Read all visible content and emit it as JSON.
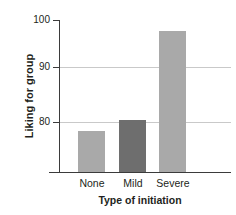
{
  "chart_data": {
    "type": "bar",
    "title": "",
    "categories": [
      "None",
      "Mild",
      "Severe"
    ],
    "values": [
      80,
      82,
      98
    ],
    "series": [
      {
        "name": "Liking for group",
        "values": [
          80,
          82,
          98
        ]
      }
    ],
    "xlabel": "Type of initiation",
    "ylabel": "Liking for group",
    "ylim": [
      72.5,
      100
    ],
    "yticks": [
      80,
      90,
      100
    ],
    "ytick_labels": [
      "80",
      "90",
      "100"
    ],
    "grid": true,
    "gridlines_at": [
      80,
      90
    ],
    "legend": "none",
    "bar_colors": [
      "#a9a9a9",
      "#6e6e6e",
      "#a9a9a9"
    ],
    "axis_color": "#3b3b3b",
    "grid_color": "#c9c9c9",
    "text_color": "#231f20",
    "background": "#ffffff"
  }
}
